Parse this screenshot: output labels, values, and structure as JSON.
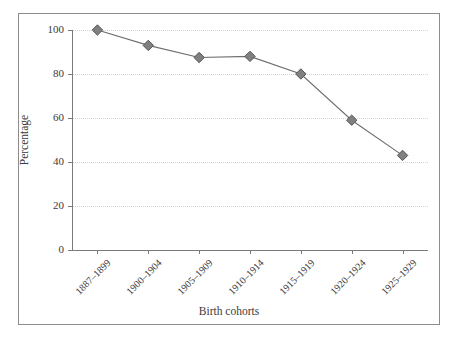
{
  "chart_data": {
    "type": "line",
    "title": "",
    "subtitle": "",
    "xlabel": "Birth cohorts",
    "ylabel": "Percentage",
    "categories": [
      "1887–1899",
      "1900–1904",
      "1905–1909",
      "1910–1914",
      "1915–1919",
      "1920–1924",
      "1925–1929"
    ],
    "values": [
      100,
      93,
      87.5,
      88,
      80,
      59,
      43
    ],
    "series": [
      {
        "name": "Percentage",
        "values": [
          100,
          93,
          87.5,
          88,
          80,
          59,
          43
        ]
      }
    ],
    "ylim": [
      0,
      100
    ],
    "yticks": [
      0,
      20,
      40,
      60,
      80,
      100
    ],
    "ytick_labels": [
      "0",
      "20",
      "40",
      "60",
      "80",
      "100"
    ],
    "grid": "horizontal-dotted",
    "legend": "none",
    "marker": "diamond",
    "marker_color": "#808080",
    "marker_edge_color": "#555555",
    "line_color": "#6e6e6e",
    "grid_color": "#d2d2d2",
    "axis_color": "#7b7b7b",
    "frame_color": "#8c8c8c",
    "text_color": "#3a3a3a",
    "background": "#ffffff"
  }
}
